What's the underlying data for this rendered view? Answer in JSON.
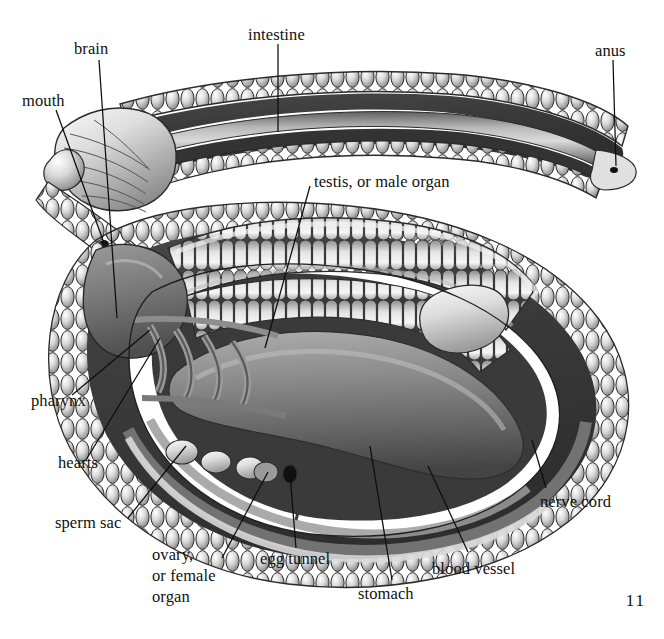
{
  "figure": {
    "page_number": "11",
    "background_color": "#ffffff",
    "ink_color": "#111111",
    "palette": {
      "body_wall_dark": "#3b3b3b",
      "body_wall_mid": "#6e6e6e",
      "segment_light": "#e6e6e6",
      "segment_highlight": "#fdfdfd",
      "organ_mid": "#8a8a8a",
      "organ_shadow": "#4a4a4a",
      "outline": "#1a1a1a"
    }
  },
  "labels": [
    {
      "id": "intestine",
      "text": "intestine"
    },
    {
      "id": "anus",
      "text": "anus"
    },
    {
      "id": "brain",
      "text": "brain"
    },
    {
      "id": "mouth",
      "text": "mouth"
    },
    {
      "id": "testis",
      "text": "testis, or male organ"
    },
    {
      "id": "pharynx",
      "text": "pharynx"
    },
    {
      "id": "hearts",
      "text": "hearts"
    },
    {
      "id": "sperm_sac",
      "text": "sperm sac"
    },
    {
      "id": "ovary",
      "text": "ovary,\nor female\norgan"
    },
    {
      "id": "egg_tunnel",
      "text": "egg tunnel"
    },
    {
      "id": "stomach",
      "text": "stomach"
    },
    {
      "id": "blood_vessel",
      "text": "blood vessel"
    },
    {
      "id": "nerve_cord",
      "text": "nerve cord"
    }
  ]
}
